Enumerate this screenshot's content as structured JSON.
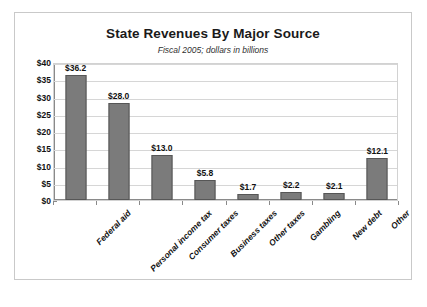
{
  "chart_data": {
    "type": "bar",
    "title": "State Revenues By Major Source",
    "subtitle": "Fiscal 2005; dollars in billions",
    "xlabel": "",
    "ylabel": "",
    "ylim": [
      0,
      40
    ],
    "ytick_step": 5,
    "grid": true,
    "legend": "none",
    "bar_color": "#7b7b7b",
    "bar_border_color": "#565656",
    "categories": [
      "Federal aid",
      "Personal income tax",
      "Consumer taxes",
      "Business taxes",
      "Other taxes",
      "Gambling",
      "New debt",
      "Other"
    ],
    "values": [
      36.2,
      28.0,
      13.0,
      5.8,
      1.7,
      2.2,
      2.1,
      12.1
    ],
    "value_labels": [
      "$36.2",
      "$28.0",
      "$13.0",
      "$5.8",
      "$1.7",
      "$2.2",
      "$2.1",
      "$12.1"
    ],
    "ytick_labels": [
      "$40",
      "$35",
      "$30",
      "$25",
      "$20",
      "$15",
      "$10",
      "$5",
      "$0"
    ],
    "ytick_values": [
      40,
      35,
      30,
      25,
      20,
      15,
      10,
      5,
      0
    ]
  }
}
